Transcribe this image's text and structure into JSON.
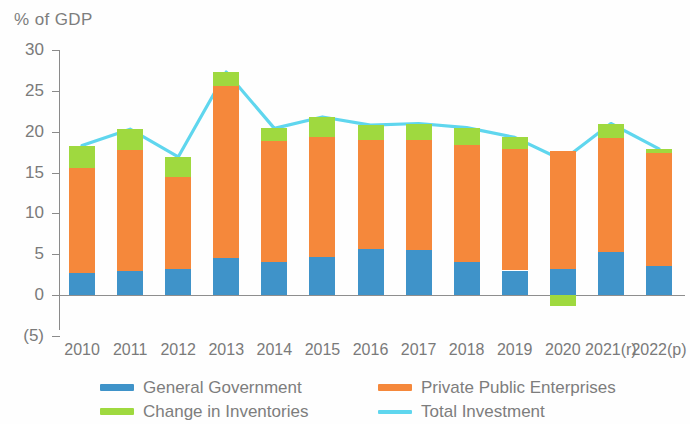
{
  "chart_data": {
    "type": "bar",
    "title": "",
    "subtitle": "",
    "xlabel": "",
    "ylabel": "% of GDP",
    "ylim": [
      -5,
      30
    ],
    "yticks": [
      -5,
      0,
      5,
      10,
      15,
      20,
      25,
      30
    ],
    "ytick_labels": [
      "(5)",
      "0",
      "5",
      "10",
      "15",
      "20",
      "25",
      "30"
    ],
    "grid": false,
    "stacked": true,
    "legend_position": "bottom",
    "categories": [
      "2010",
      "2011",
      "2012",
      "2013",
      "2014",
      "2015",
      "2016",
      "2017",
      "2018",
      "2019",
      "2020",
      "2021(r)",
      "2022(p)"
    ],
    "series": [
      {
        "name": "General Government",
        "type": "bar",
        "color": "#3f93c9",
        "values": [
          2.7,
          2.9,
          3.2,
          4.5,
          4.1,
          4.7,
          5.6,
          5.5,
          4.0,
          3.0,
          3.2,
          5.3,
          3.5
        ]
      },
      {
        "name": "Private Public Enterprises",
        "type": "bar",
        "color": "#f5883b",
        "values": [
          12.8,
          14.8,
          11.3,
          21.1,
          14.7,
          14.6,
          13.4,
          13.5,
          14.4,
          14.9,
          14.4,
          13.9,
          13.9
        ]
      },
      {
        "name": "Change in Inventories",
        "type": "bar",
        "color": "#9fd93f",
        "values": [
          2.8,
          2.6,
          2.4,
          1.7,
          1.6,
          2.5,
          1.8,
          2.0,
          2.1,
          1.4,
          -1.3,
          1.8,
          0.5
        ]
      },
      {
        "name": "Total Investment",
        "type": "line",
        "color": "#5fd6ee",
        "values": [
          18.3,
          20.3,
          16.9,
          27.3,
          20.4,
          21.8,
          20.8,
          21.0,
          20.5,
          19.3,
          16.5,
          21.0,
          17.9
        ]
      }
    ]
  },
  "axis": {
    "y_title": "% of GDP"
  },
  "legend": {
    "items": [
      {
        "label": "General Government",
        "color": "#3f93c9",
        "marker": "bar"
      },
      {
        "label": "Private Public Enterprises",
        "color": "#f5883b",
        "marker": "bar"
      },
      {
        "label": "Change in Inventories",
        "color": "#9fd93f",
        "marker": "bar"
      },
      {
        "label": "Total Investment",
        "color": "#5fd6ee",
        "marker": "line"
      }
    ]
  }
}
